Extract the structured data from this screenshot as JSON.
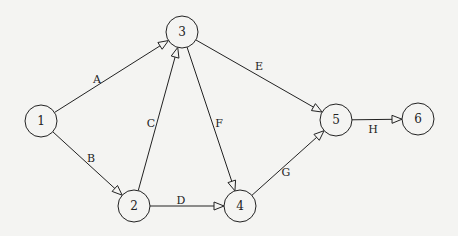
{
  "diagram": {
    "type": "directed-network",
    "nodes": [
      {
        "id": "1",
        "label": "1",
        "x": 41,
        "y": 121
      },
      {
        "id": "2",
        "label": "2",
        "x": 134,
        "y": 206
      },
      {
        "id": "3",
        "label": "3",
        "x": 182,
        "y": 32
      },
      {
        "id": "4",
        "label": "4",
        "x": 240,
        "y": 206
      },
      {
        "id": "5",
        "label": "5",
        "x": 336,
        "y": 120
      },
      {
        "id": "6",
        "label": "6",
        "x": 418,
        "y": 119
      }
    ],
    "edges": [
      {
        "id": "A",
        "label": "A",
        "from": "1",
        "to": "3",
        "lx": 97,
        "ly": 83
      },
      {
        "id": "B",
        "label": "B",
        "from": "1",
        "to": "2",
        "lx": 91,
        "ly": 162
      },
      {
        "id": "C",
        "label": "C",
        "from": "2",
        "to": "3",
        "lx": 151,
        "ly": 127
      },
      {
        "id": "D",
        "label": "D",
        "from": "2",
        "to": "4",
        "lx": 181,
        "ly": 204
      },
      {
        "id": "E",
        "label": "E",
        "from": "3",
        "to": "5",
        "lx": 259,
        "ly": 70
      },
      {
        "id": "F",
        "label": "F",
        "from": "3",
        "to": "4",
        "lx": 219,
        "ly": 127
      },
      {
        "id": "G",
        "label": "G",
        "from": "4",
        "to": "5",
        "lx": 286,
        "ly": 176
      },
      {
        "id": "H",
        "label": "H",
        "from": "5",
        "to": "6",
        "lx": 373,
        "ly": 133
      }
    ],
    "node_radius": 16,
    "stroke_color": "#222222",
    "background": "#f4f4f2"
  }
}
